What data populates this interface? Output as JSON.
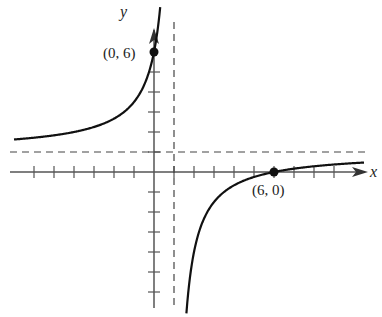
{
  "chart_data": {
    "type": "line",
    "title": "",
    "function": "y = (x - 6) / (x - 1)",
    "xlabel": "x",
    "ylabel": "y",
    "xlim": [
      -7,
      10.5
    ],
    "ylim": [
      -7,
      7.5
    ],
    "tick_spacing": 1,
    "grid": false,
    "asymptotes": {
      "vertical": 1,
      "horizontal": 1
    },
    "points": [
      {
        "label": "(0, 6)",
        "x": 0,
        "y": 6
      },
      {
        "label": "(6, 0)",
        "x": 6,
        "y": 0
      }
    ]
  },
  "labels": {
    "x_axis": "x",
    "y_axis": "y",
    "point_y_intercept": "(0, 6)",
    "point_x_intercept": "(6, 0)"
  },
  "colors": {
    "axis": "#555555",
    "curve": "#111111",
    "asymptote": "#444444"
  }
}
